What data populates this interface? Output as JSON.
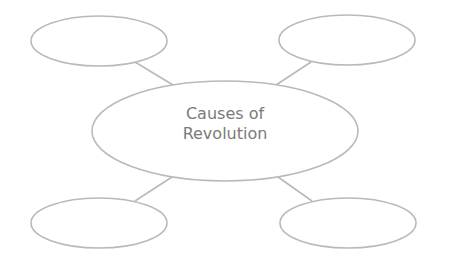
{
  "diagram": {
    "type": "mind-map",
    "colors": {
      "stroke": "#b9b9b9",
      "text": "#7a7a7a",
      "background": "#ffffff"
    },
    "center": {
      "line1": "Causes of",
      "line2": "Revolution"
    },
    "branches": [
      {
        "position": "top-left",
        "label": ""
      },
      {
        "position": "top-right",
        "label": ""
      },
      {
        "position": "bottom-left",
        "label": ""
      },
      {
        "position": "bottom-right",
        "label": ""
      }
    ]
  }
}
